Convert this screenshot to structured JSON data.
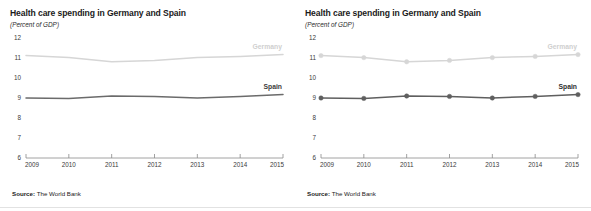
{
  "charts": [
    {
      "id": "left",
      "title": "Health care spending in Germany and Spain",
      "subtitle": "(Percent of GDP)",
      "source": "Source: The World Bank",
      "source_prefix": "Source:",
      "source_value": "The World Bank",
      "markers": false
    },
    {
      "id": "right",
      "title": "Health care spending in Germany and Spain",
      "subtitle": "(Percent of GDP)",
      "source": "Source: The World Bank",
      "source_prefix": "Source:",
      "source_value": "The World Bank",
      "markers": true
    }
  ],
  "chart_data": [
    {
      "type": "line",
      "title": "Health care spending in Germany and Spain",
      "subtitle": "(Percent of GDP)",
      "xlabel": "",
      "ylabel": "",
      "ylim": [
        6,
        12
      ],
      "yticks": [
        12,
        11,
        10,
        9,
        8,
        7,
        6
      ],
      "ytick_labels": [
        "12",
        "11",
        "10",
        "9",
        "8",
        "7",
        "6"
      ],
      "x": [
        2009,
        2010,
        2011,
        2012,
        2013,
        2014,
        2015
      ],
      "xtick_labels": [
        "2009",
        "2010",
        "2011",
        "2012",
        "2013",
        "2014",
        "2015"
      ],
      "grid": false,
      "legend": "inline-right",
      "markers": false,
      "source": "Source: The World Bank",
      "series": [
        {
          "name": "Germany",
          "color": "#d6d6d6",
          "label_color": "#cfcfcf",
          "values": [
            11.12,
            11.02,
            10.81,
            10.88,
            11.02,
            11.08,
            11.17
          ]
        },
        {
          "name": "Spain",
          "color": "#6b6b6b",
          "label_color": "#3d3d3d",
          "values": [
            9.0,
            8.98,
            9.1,
            9.08,
            9.0,
            9.08,
            9.17
          ]
        }
      ]
    },
    {
      "type": "line",
      "title": "Health care spending in Germany and Spain",
      "subtitle": "(Percent of GDP)",
      "xlabel": "",
      "ylabel": "",
      "ylim": [
        6,
        12
      ],
      "yticks": [
        12,
        11,
        10,
        9,
        8,
        7,
        6
      ],
      "ytick_labels": [
        "12",
        "11",
        "10",
        "9",
        "8",
        "7",
        "6"
      ],
      "x": [
        2009,
        2010,
        2011,
        2012,
        2013,
        2014,
        2015
      ],
      "xtick_labels": [
        "2009",
        "2010",
        "2011",
        "2012",
        "2013",
        "2014",
        "2015"
      ],
      "grid": false,
      "legend": "inline-right",
      "markers": true,
      "source": "Source: The World Bank",
      "series": [
        {
          "name": "Germany",
          "color": "#d6d6d6",
          "label_color": "#cfcfcf",
          "values": [
            11.12,
            11.02,
            10.81,
            10.88,
            11.02,
            11.08,
            11.17
          ]
        },
        {
          "name": "Spain",
          "color": "#5f5f5f",
          "label_color": "#2e2e2e",
          "values": [
            9.0,
            8.98,
            9.1,
            9.08,
            9.0,
            9.08,
            9.17
          ]
        }
      ]
    }
  ]
}
